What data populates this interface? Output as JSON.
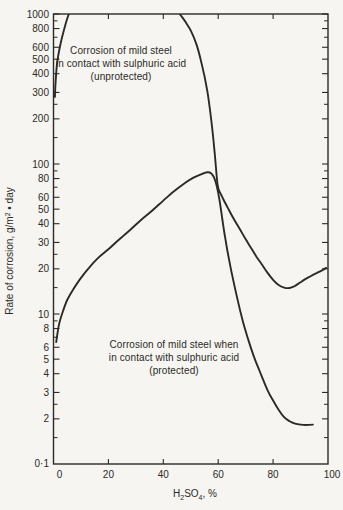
{
  "page": {
    "background": "#f6f5f1",
    "ink": "#2c2a27"
  },
  "chart_data": {
    "type": "line",
    "title": "",
    "x_axis": {
      "label_parts": [
        {
          "t": "H"
        },
        {
          "t": "2",
          "sub": true
        },
        {
          "t": "SO"
        },
        {
          "t": "4",
          "sub": true
        },
        {
          "t": ", %"
        }
      ],
      "label_text": "H2SO4, %",
      "range": [
        0,
        100
      ],
      "labeled_ticks": [
        0,
        20,
        40,
        60,
        80,
        100
      ],
      "inner_ticks": [
        20,
        40,
        60,
        80
      ]
    },
    "y_axis": {
      "label_parts": [
        {
          "t": "Rate of corrosion, g/m"
        },
        {
          "t": "2",
          "sup": true
        },
        {
          "t": " • day"
        }
      ],
      "label_text": "Rate of corrosion, g/m2 • day",
      "scale": "log",
      "range": [
        1,
        1000
      ],
      "labeled_ticks": [
        1000,
        800,
        600,
        500,
        400,
        300,
        200,
        100,
        80,
        60,
        50,
        40,
        30,
        20,
        10,
        8,
        6,
        5,
        4,
        3,
        2
      ],
      "minor_ticks": [
        900,
        700,
        250,
        150,
        90,
        70,
        25,
        15,
        9,
        7,
        2.5,
        1.5
      ],
      "bottom_tick_label": "0·1"
    },
    "grid": false,
    "legend": "inline-annotations",
    "series": [
      {
        "name": "unprotected",
        "annotation": {
          "lines": [
            "Corrosion of mild steel",
            "in contact with sulphuric acid",
            "(unprotected)"
          ]
        },
        "points": [
          [
            0.5,
            280
          ],
          [
            0.8,
            360
          ],
          [
            1.3,
            470
          ],
          [
            2.3,
            600
          ],
          [
            3.7,
            770
          ],
          [
            5.6,
            1000
          ],
          [
            8,
            1200
          ],
          [
            43,
            1200
          ],
          [
            46,
            1000
          ],
          [
            48,
            890
          ],
          [
            50,
            775
          ],
          [
            52,
            635
          ],
          [
            54,
            465
          ],
          [
            56,
            310
          ],
          [
            57.5,
            195
          ],
          [
            58.7,
            120
          ],
          [
            59.8,
            72
          ],
          [
            61,
            63
          ],
          [
            62,
            57.5
          ],
          [
            64,
            49
          ],
          [
            66,
            42
          ],
          [
            68,
            36.5
          ],
          [
            70,
            31.5
          ],
          [
            72,
            27.5
          ],
          [
            74,
            24
          ],
          [
            76,
            21.3
          ],
          [
            78,
            18.8
          ],
          [
            80,
            16.9
          ],
          [
            82,
            15.6
          ],
          [
            84,
            15
          ],
          [
            86,
            14.9
          ],
          [
            88,
            15.4
          ],
          [
            90,
            16.3
          ],
          [
            93,
            17.6
          ],
          [
            96,
            18.8
          ],
          [
            98,
            19.6
          ],
          [
            99.3,
            20.3
          ]
        ]
      },
      {
        "name": "protected",
        "annotation": {
          "lines": [
            "Corrosion of mild steel when",
            "in contact with sulphuric acid",
            "(protected)"
          ]
        },
        "points": [
          [
            1,
            6.5
          ],
          [
            2,
            8.5
          ],
          [
            3.5,
            10.5
          ],
          [
            5,
            12.4
          ],
          [
            7,
            14.4
          ],
          [
            10,
            17.4
          ],
          [
            13,
            20.4
          ],
          [
            16,
            23.4
          ],
          [
            20,
            27
          ],
          [
            24,
            31.5
          ],
          [
            28,
            36.5
          ],
          [
            32,
            42.5
          ],
          [
            36,
            49
          ],
          [
            40,
            57
          ],
          [
            44,
            66
          ],
          [
            48,
            75
          ],
          [
            51,
            81
          ],
          [
            53.5,
            85
          ],
          [
            56,
            88
          ],
          [
            57.5,
            86.5
          ],
          [
            58.5,
            81
          ],
          [
            59.5,
            71
          ],
          [
            60.5,
            57
          ],
          [
            61.5,
            43
          ],
          [
            62.5,
            32.5
          ],
          [
            63.5,
            25.5
          ],
          [
            65,
            18.5
          ],
          [
            67,
            12.6
          ],
          [
            69,
            8.9
          ],
          [
            71,
            6.7
          ],
          [
            73,
            5.2
          ],
          [
            75,
            4.2
          ],
          [
            78,
            3.1
          ],
          [
            80,
            2.65
          ],
          [
            82,
            2.3
          ],
          [
            84,
            2.05
          ],
          [
            86,
            1.93
          ],
          [
            88,
            1.86
          ],
          [
            90,
            1.83
          ],
          [
            92,
            1.82
          ],
          [
            94.5,
            1.83
          ]
        ]
      }
    ]
  }
}
